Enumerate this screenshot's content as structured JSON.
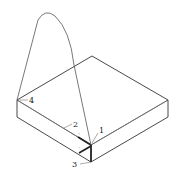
{
  "diagram": {
    "type": "isometric slab with curved path",
    "labels": [
      {
        "id": "1",
        "text": "1"
      },
      {
        "id": "2",
        "text": "2"
      },
      {
        "id": "3",
        "text": "3"
      },
      {
        "id": "4",
        "text": "4"
      }
    ],
    "colors": {
      "outline": "#333333",
      "curve": "#555555",
      "thick_mark": "#222222",
      "background": "#ffffff"
    }
  }
}
